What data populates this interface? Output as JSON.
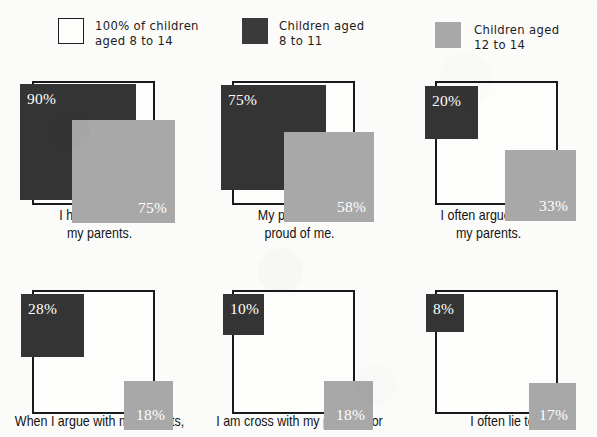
{
  "legend": {
    "items": [
      {
        "name": "reference-100",
        "swatch": "reference-swatch",
        "color": "#fdfdfc",
        "label": "100% of children\naged 8 to 14"
      },
      {
        "name": "aged-8-to-11",
        "swatch": "dark-swatch",
        "color": "#3a3a3a",
        "label": "Children aged\n8 to 11"
      },
      {
        "name": "aged-12-to-14",
        "swatch": "gray-swatch",
        "color": "#a8a8a8",
        "label": "Children aged\n12 to 14"
      }
    ]
  },
  "chart_data": {
    "type": "bar",
    "title": "",
    "subtitle": "",
    "xlabel": "",
    "ylabel": "",
    "grid": false,
    "legend_position": "top",
    "note": "Area-proportional nested squares; each panel shows a white 100% reference square with two overlapping filled squares sized by percentage.",
    "categories": [
      "I have fun with my parents.",
      "My parents are proud of me.",
      "I often argue with my parents.",
      "When I argue with my parents,",
      "I am cross with my parents for",
      "I often lie to"
    ],
    "series": [
      {
        "name": "Children aged 8 to 11",
        "color": "#343434",
        "values": [
          90,
          75,
          20,
          28,
          10,
          8
        ]
      },
      {
        "name": "Children aged 12 to 14",
        "color": "#a8a8a8",
        "values": [
          75,
          58,
          33,
          18,
          18,
          17
        ]
      }
    ],
    "reference_value": 100,
    "unit": "%"
  },
  "panels": [
    {
      "caption": "I have fun with\nmy parents.",
      "dark": {
        "value": "90%",
        "size": 116,
        "dx": -12,
        "dy": 3
      },
      "gray": {
        "value": "75%",
        "size": 103,
        "dx": 20,
        "dy": 18
      }
    },
    {
      "caption": "My parents are\nproud of me.",
      "dark": {
        "value": "75%",
        "size": 105,
        "dx": -11,
        "dy": 4
      },
      "gray": {
        "value": "58%",
        "size": 90,
        "dx": 19,
        "dy": 17
      }
    },
    {
      "caption": "I often argue with\nmy parents.",
      "dark": {
        "value": "20%",
        "size": 53,
        "dx": -10,
        "dy": 5
      },
      "gray": {
        "value": "33%",
        "size": 71,
        "dx": 18,
        "dy": 16
      }
    },
    {
      "caption": "When I argue with my parents,",
      "dark": {
        "value": "28%",
        "size": 63,
        "dx": -11,
        "dy": 4
      },
      "gray": {
        "value": "18%",
        "size": 49,
        "dx": 18,
        "dy": 16
      }
    },
    {
      "caption": "I am cross with my parents for",
      "dark": {
        "value": "10%",
        "size": 41,
        "dx": -9,
        "dy": 4
      },
      "gray": {
        "value": "18%",
        "size": 49,
        "dx": 18,
        "dy": 16
      }
    },
    {
      "caption": "I often lie to",
      "dark": {
        "value": "8%",
        "size": 38,
        "dx": -9,
        "dy": 4
      },
      "gray": {
        "value": "17%",
        "size": 47,
        "dx": 18,
        "dy": 16
      }
    }
  ]
}
